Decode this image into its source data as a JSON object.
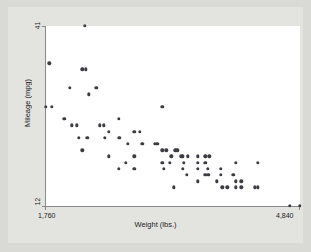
{
  "chart_data": {
    "type": "scatter",
    "title": "",
    "xlabel": "Weight (lbs.)",
    "ylabel": "Mileage (mpg)",
    "xlim": [
      1760,
      4840
    ],
    "ylim": [
      12,
      41
    ],
    "xticks": [
      "1,760",
      "4,840"
    ],
    "yticks": [
      "41",
      "12"
    ],
    "grid": false,
    "legend": null,
    "point_color": "#3c3c42",
    "plot_background": "#ffffff",
    "graph_background": "#e3e3e0",
    "n_points": 74,
    "points": [
      {
        "x": 2230,
        "y": 41
      },
      {
        "x": 1800,
        "y": 35
      },
      {
        "x": 2200,
        "y": 34
      },
      {
        "x": 2240,
        "y": 34
      },
      {
        "x": 2050,
        "y": 31
      },
      {
        "x": 2370,
        "y": 31
      },
      {
        "x": 2280,
        "y": 30
      },
      {
        "x": 1760,
        "y": 28
      },
      {
        "x": 1830,
        "y": 28
      },
      {
        "x": 3170,
        "y": 28
      },
      {
        "x": 1980,
        "y": 26
      },
      {
        "x": 2640,
        "y": 26
      },
      {
        "x": 2070,
        "y": 25
      },
      {
        "x": 2130,
        "y": 25
      },
      {
        "x": 2410,
        "y": 25
      },
      {
        "x": 2460,
        "y": 25
      },
      {
        "x": 2520,
        "y": 24
      },
      {
        "x": 2830,
        "y": 24
      },
      {
        "x": 2900,
        "y": 24
      },
      {
        "x": 2160,
        "y": 23
      },
      {
        "x": 2260,
        "y": 23
      },
      {
        "x": 2470,
        "y": 23
      },
      {
        "x": 2650,
        "y": 23
      },
      {
        "x": 2750,
        "y": 22
      },
      {
        "x": 2930,
        "y": 22
      },
      {
        "x": 3080,
        "y": 22
      },
      {
        "x": 3110,
        "y": 22
      },
      {
        "x": 2200,
        "y": 21
      },
      {
        "x": 3170,
        "y": 21
      },
      {
        "x": 3220,
        "y": 21
      },
      {
        "x": 3330,
        "y": 21
      },
      {
        "x": 3350,
        "y": 21
      },
      {
        "x": 2520,
        "y": 20
      },
      {
        "x": 2830,
        "y": 20
      },
      {
        "x": 3280,
        "y": 20
      },
      {
        "x": 3400,
        "y": 20
      },
      {
        "x": 3420,
        "y": 20
      },
      {
        "x": 3480,
        "y": 20
      },
      {
        "x": 3600,
        "y": 20
      },
      {
        "x": 3690,
        "y": 20
      },
      {
        "x": 3740,
        "y": 20
      },
      {
        "x": 4060,
        "y": 19
      },
      {
        "x": 4330,
        "y": 19
      },
      {
        "x": 2730,
        "y": 19
      },
      {
        "x": 3170,
        "y": 19
      },
      {
        "x": 3260,
        "y": 19
      },
      {
        "x": 3430,
        "y": 19
      },
      {
        "x": 3600,
        "y": 19
      },
      {
        "x": 3690,
        "y": 19
      },
      {
        "x": 2640,
        "y": 18
      },
      {
        "x": 3190,
        "y": 18
      },
      {
        "x": 3420,
        "y": 18
      },
      {
        "x": 3600,
        "y": 18
      },
      {
        "x": 3720,
        "y": 18
      },
      {
        "x": 3880,
        "y": 18
      },
      {
        "x": 2830,
        "y": 18
      },
      {
        "x": 3470,
        "y": 17
      },
      {
        "x": 3690,
        "y": 17
      },
      {
        "x": 3730,
        "y": 17
      },
      {
        "x": 3880,
        "y": 17
      },
      {
        "x": 4030,
        "y": 17
      },
      {
        "x": 3600,
        "y": 16
      },
      {
        "x": 3830,
        "y": 16
      },
      {
        "x": 4060,
        "y": 16
      },
      {
        "x": 4130,
        "y": 16
      },
      {
        "x": 3310,
        "y": 15
      },
      {
        "x": 3900,
        "y": 15
      },
      {
        "x": 3960,
        "y": 15
      },
      {
        "x": 4060,
        "y": 15
      },
      {
        "x": 4130,
        "y": 15
      },
      {
        "x": 4290,
        "y": 15
      },
      {
        "x": 4330,
        "y": 15
      },
      {
        "x": 4720,
        "y": 12
      },
      {
        "x": 4840,
        "y": 12
      }
    ]
  }
}
